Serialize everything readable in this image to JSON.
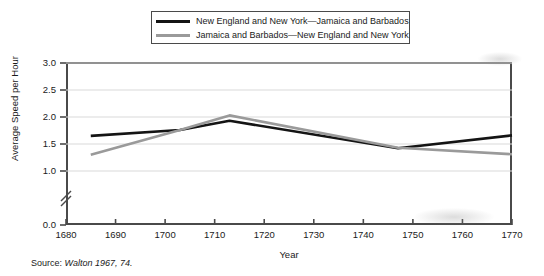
{
  "chart_data": {
    "type": "line",
    "title": "",
    "subtitle": "",
    "xlabel": "Year",
    "ylabel": "Average Speed per Hour",
    "xlim": [
      1680,
      1770
    ],
    "ylim": [
      0.0,
      3.0
    ],
    "y_axis_break": true,
    "y_break_between": [
      0.0,
      1.0
    ],
    "grid": true,
    "grid_axis": "y",
    "legend_position": "top-center",
    "xticks": [
      1680,
      1690,
      1700,
      1710,
      1720,
      1730,
      1740,
      1750,
      1760,
      1770
    ],
    "xtick_labels": [
      "1680",
      "1690",
      "1700",
      "1710",
      "1720",
      "1730",
      "1740",
      "1750",
      "1760",
      "1770"
    ],
    "yticks": [
      0.0,
      1.0,
      1.5,
      2.0,
      2.5,
      3.0
    ],
    "ytick_labels": [
      "0.0",
      "1.0",
      "1.5",
      "2.0",
      "2.5",
      "3.0"
    ],
    "series": [
      {
        "name": "New England and New York—Jamaica and Barbados",
        "color": "#141414",
        "x": [
          1685,
          1703,
          1713,
          1747,
          1770
        ],
        "values": [
          1.65,
          1.76,
          1.93,
          1.42,
          1.66
        ]
      },
      {
        "name": "Jamaica and Barbados—New England and New York",
        "color": "#9a9a9a",
        "x": [
          1685,
          1703,
          1713,
          1747,
          1770
        ],
        "values": [
          1.3,
          1.76,
          2.03,
          1.43,
          1.31
        ]
      }
    ]
  },
  "legend": {
    "entries": [
      {
        "label": "New England and New York—Jamaica and Barbados",
        "color": "#141414"
      },
      {
        "label": "Jamaica and Barbados—New England and New York",
        "color": "#9a9a9a"
      }
    ]
  },
  "axes": {
    "ylabel": "Average Speed per Hour",
    "xlabel": "Year",
    "ytick_labels": [
      "3.0",
      "2.5",
      "2.0",
      "1.5",
      "1.0",
      "0.0"
    ],
    "xtick_labels": [
      "1680",
      "1690",
      "1700",
      "1710",
      "1720",
      "1730",
      "1740",
      "1750",
      "1760",
      "1770"
    ]
  },
  "source": {
    "label": "Source:",
    "citation": "Walton 1967, 74."
  },
  "colors": {
    "series_1": "#141414",
    "series_2": "#9a9a9a",
    "frame": "#4a4a4a",
    "grid": "#d9d9d9",
    "text": "#1a1a1a",
    "background": "#ffffff"
  }
}
